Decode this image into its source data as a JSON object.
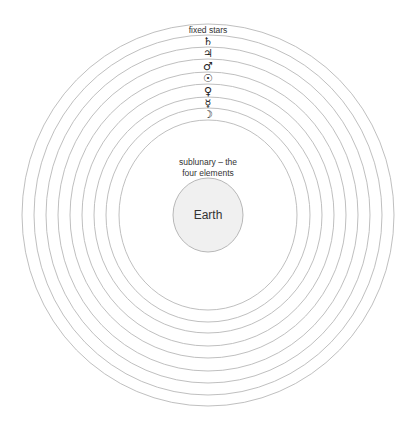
{
  "diagram": {
    "spheres": [
      {
        "name": "fixed stars",
        "label": "fixed stars",
        "kind": "text"
      },
      {
        "name": "saturn",
        "label": "♄",
        "kind": "symbol"
      },
      {
        "name": "jupiter",
        "label": "♃",
        "kind": "symbol"
      },
      {
        "name": "mars",
        "label": "♂",
        "kind": "symbol"
      },
      {
        "name": "sun",
        "label": "☉",
        "kind": "symbol"
      },
      {
        "name": "venus",
        "label": "♀",
        "kind": "symbol"
      },
      {
        "name": "mercury",
        "label": "☿",
        "kind": "symbol"
      },
      {
        "name": "moon",
        "label": "☽",
        "kind": "symbol"
      }
    ],
    "sublunary": {
      "line1": "sublunary – the",
      "line2": "four elements"
    },
    "center": {
      "label": "Earth"
    },
    "colors": {
      "ring": "#b8b8b8",
      "earth_fill": "#f0f0f0",
      "text": "#333333"
    }
  }
}
